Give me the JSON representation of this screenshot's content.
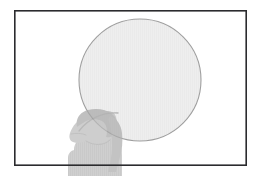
{
  "image": {
    "kind": "illustration",
    "width": 260,
    "height": 176,
    "background_color": "#ffffff",
    "description": "Line-art illustration: a thin dark rectangular frame on a white background containing a large pale grey circle, with a translucent grey silhouette of a person's head and shoulders in profile at the lower left, overlapping the circle and extending past the bottom edge of the frame."
  },
  "frame": {
    "name": "border-rectangle",
    "x": 14,
    "y": 10,
    "width": 233,
    "height": 156,
    "stroke_color": "#2b2b2e",
    "stroke_width": 1.6,
    "fill_color": "#ffffff"
  },
  "circle": {
    "name": "large-circle",
    "center_x": 140,
    "center_y": 80,
    "radius": 61,
    "fill_color": "#ededed",
    "stroke_color": "#9a9a9a",
    "stroke_width": 1.1,
    "opacity": 0.95
  },
  "silhouette": {
    "name": "person-head-and-shoulders",
    "orientation": "profile-facing-left",
    "fill_color": "#b9b9b9",
    "hair_color": "#a8a8a8",
    "opacity": 0.72,
    "bounds": {
      "x": 62,
      "y": 110,
      "width": 58,
      "height": 66
    },
    "parts": [
      "hair",
      "face",
      "neck",
      "shoulders",
      "ponytail"
    ]
  },
  "palette": {
    "white": "#ffffff",
    "frame_dark": "#2b2b2e",
    "circle_fill": "#ededed",
    "circle_stroke": "#9a9a9a",
    "silhouette_gray": "#b9b9b9",
    "silhouette_dark_gray": "#a0a0a0"
  },
  "texts": {
    "title": "",
    "caption": "",
    "labels": []
  }
}
